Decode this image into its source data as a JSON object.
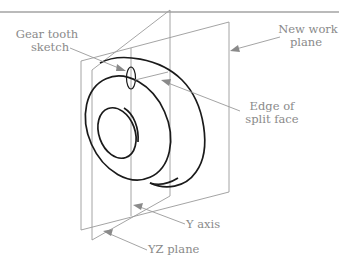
{
  "figure": {
    "labels": {
      "gear_tooth_line1": "Gear tooth",
      "gear_tooth_line2": "sketch",
      "new_work_line1": "New work",
      "new_work_line2": "plane",
      "edge_split_line1": "Edge of",
      "edge_split_line2": "split face",
      "y_axis": "Y axis",
      "yz_plane": "YZ plane"
    },
    "colors": {
      "part_stroke": "#1a1a1a",
      "construction_stroke": "#9a9a9a",
      "label_text": "#8a8a8a",
      "top_rule": "#777777"
    }
  }
}
